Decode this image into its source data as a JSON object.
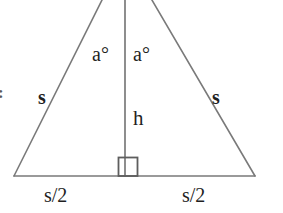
{
  "figure": {
    "kind": "isosceles-triangle-with-altitude",
    "background_color": "#ffffff",
    "line_color": "#7a7a7a",
    "text_color": "#1f1f1f"
  },
  "labels": {
    "angle_left": "a°",
    "angle_right": "a°",
    "side_left": "s",
    "side_right": "s",
    "height": "h",
    "base_left": "s/2",
    "base_right": "s/2",
    "margin_mark": ":"
  },
  "geometry": {
    "apex_x": 125,
    "apex_y": -46,
    "base_left_x": 14,
    "base_right_x": 255,
    "base_y": 176,
    "altitude_x": 125,
    "right_angle_box": {
      "x": 118,
      "y": 157,
      "size": 19
    }
  }
}
